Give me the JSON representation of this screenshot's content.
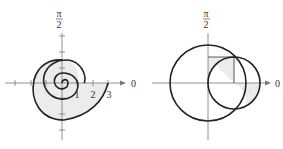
{
  "figures": [
    {
      "name": "spiral-polar-graph",
      "axis_labels": {
        "top": "π/2",
        "right": "0"
      },
      "pi_num": "π",
      "pi_den": "2",
      "zero": "0",
      "ticks": [
        "1",
        "2",
        "3"
      ]
    },
    {
      "name": "two-circles-polar-graph",
      "axis_labels": {
        "top": "π/2",
        "right": "0"
      },
      "pi_num": "π",
      "pi_den": "2",
      "zero": "0"
    }
  ],
  "colors": {
    "curve": "#222222",
    "axis": "#777777",
    "shade": "#ececec"
  }
}
